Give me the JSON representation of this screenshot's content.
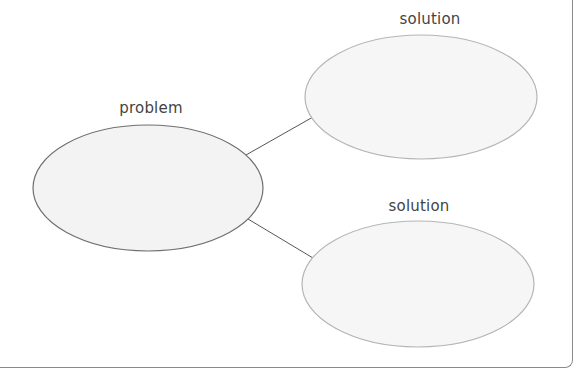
{
  "diagram": {
    "type": "problem-solution web",
    "nodes": [
      {
        "id": "problem",
        "label": "problem",
        "cx": 148,
        "cy": 188,
        "rx": 115,
        "ry": 63,
        "stroke": "#6f6f6f",
        "fill": "#f3f3f3"
      },
      {
        "id": "solution1",
        "label": "solution",
        "cx": 421,
        "cy": 97,
        "rx": 116,
        "ry": 62,
        "stroke": "#b5b5b5",
        "fill": "#f5f5f5"
      },
      {
        "id": "solution2",
        "label": "solution",
        "cx": 418,
        "cy": 284,
        "rx": 116,
        "ry": 63,
        "stroke": "#b5b5b5",
        "fill": "#f5f5f5"
      }
    ],
    "edges": [
      {
        "from": "problem",
        "to": "solution1",
        "x1": 246,
        "y1": 155,
        "x2": 313,
        "y2": 117
      },
      {
        "from": "problem",
        "to": "solution2",
        "x1": 248,
        "y1": 219,
        "x2": 313,
        "y2": 258
      }
    ]
  },
  "labels": {
    "problem": "problem",
    "solution_top": "solution",
    "solution_bottom": "solution"
  }
}
